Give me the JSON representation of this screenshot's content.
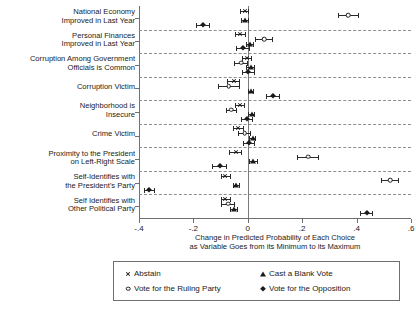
{
  "chart_data": {
    "type": "scatter",
    "title": "",
    "xlabel": "Change in Predicted Probability of Each Choice\nas Variable Goes from its Minimum to its Maximum",
    "ylabel": "",
    "xlim": [
      -0.4,
      0.6
    ],
    "xticks": [
      -0.4,
      -0.2,
      0,
      0.2,
      0.4,
      0.6
    ],
    "xticklabels": [
      "-.4",
      "-.2",
      "0",
      ".2",
      ".4",
      ".6"
    ],
    "grid": "horizontal-dashed-separators",
    "legend_position": "bottom",
    "zero_reference_line": 0,
    "categories": [
      "National Economy\nImproved in Last Year",
      "Personal Finances\nImproved in Last Year",
      "Corruption Among Government\nOfficials is Common",
      "Corruption Victim",
      "Neighborhood is\nInsecure",
      "Crime Victim",
      "Proximity to the President\non Left-Right Scale",
      "Self-Identifies with\nthe President's Party",
      "Self Identifies with\nOther Political Party"
    ],
    "series": [
      {
        "name": "Abstain",
        "marker": "x",
        "values": [
          -0.012,
          -0.028,
          -0.002,
          -0.052,
          -0.03,
          -0.035,
          -0.045,
          -0.082,
          -0.082
        ],
        "ci_low": [
          -0.03,
          -0.048,
          -0.02,
          -0.075,
          -0.048,
          -0.055,
          -0.068,
          -0.1,
          -0.1
        ],
        "ci_high": [
          0.006,
          -0.008,
          0.016,
          -0.03,
          -0.012,
          -0.015,
          -0.022,
          -0.062,
          -0.062
        ]
      },
      {
        "name": "Vote for the Ruling Party",
        "marker": "o",
        "values": [
          0.37,
          0.06,
          -0.025,
          -0.07,
          -0.06,
          -0.012,
          0.222,
          0.523,
          -0.072
        ],
        "ci_low": [
          0.332,
          0.028,
          -0.05,
          -0.11,
          -0.08,
          -0.035,
          0.182,
          0.49,
          -0.098
        ],
        "ci_high": [
          0.408,
          0.092,
          0.0,
          -0.03,
          -0.04,
          0.012,
          0.262,
          0.556,
          -0.046
        ]
      },
      {
        "name": "Cast a Blank Vote",
        "marker": "t",
        "values": [
          -0.01,
          0.008,
          0.01,
          0.012,
          0.014,
          0.018,
          0.02,
          -0.042,
          -0.05
        ],
        "ci_low": [
          -0.026,
          -0.006,
          -0.006,
          0.0,
          0.0,
          0.004,
          0.004,
          -0.056,
          -0.064
        ],
        "ci_high": [
          0.006,
          0.022,
          0.026,
          0.024,
          0.028,
          0.032,
          0.036,
          -0.028,
          -0.036
        ]
      },
      {
        "name": "Vote for the Opposition",
        "marker": "d",
        "values": [
          -0.165,
          -0.018,
          0.002,
          0.094,
          -0.002,
          0.005,
          -0.104,
          -0.362,
          0.438
        ],
        "ci_low": [
          -0.19,
          -0.044,
          -0.022,
          0.068,
          -0.024,
          -0.018,
          -0.132,
          -0.382,
          0.414
        ],
        "ci_high": [
          -0.14,
          0.008,
          0.026,
          0.12,
          0.02,
          0.028,
          -0.076,
          -0.342,
          0.462
        ]
      }
    ],
    "legend_entries": [
      {
        "label": "Abstain",
        "marker": "x"
      },
      {
        "label": "Cast a Blank Vote",
        "marker": "t"
      },
      {
        "label": "Vote for the Ruling Party",
        "marker": "o"
      },
      {
        "label": "Vote for the Opposition",
        "marker": "d"
      }
    ]
  }
}
